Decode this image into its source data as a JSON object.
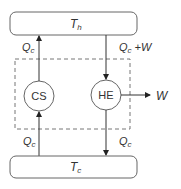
{
  "diagram": {
    "hot_reservoir": {
      "label": "T",
      "sub": "h"
    },
    "cold_reservoir": {
      "label": "T",
      "sub": "c"
    },
    "cooling_system": {
      "label": "CS"
    },
    "heat_engine": {
      "label": "HE"
    },
    "flows": {
      "cs_to_hot": {
        "label": "Q",
        "sub": "c"
      },
      "hot_to_he": {
        "label": "Q",
        "sub": "c",
        "suffix": " +W"
      },
      "cold_to_cs": {
        "label": "Q",
        "sub": "c"
      },
      "he_to_cold": {
        "label": "Q",
        "sub": "c"
      },
      "work_out": {
        "label": "W"
      }
    },
    "colors": {
      "stroke": "#555555",
      "dashed": "#777777",
      "text": "#333333"
    }
  }
}
